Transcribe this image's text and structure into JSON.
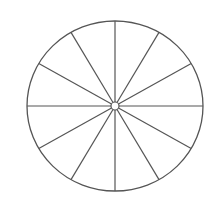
{
  "diagram": {
    "type": "segmented-circle",
    "segments": 12,
    "center": {
      "x": 115,
      "y": 106
    },
    "radius_x": 88,
    "radius_y": 85,
    "hub_radius": 4,
    "stroke_color": "#555555",
    "background_color": "#ffffff"
  }
}
